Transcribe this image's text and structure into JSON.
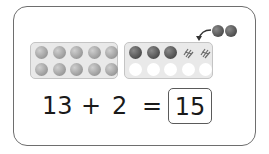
{
  "illustration": {
    "left_tray": {
      "filled": 10,
      "color": "grey"
    },
    "right_tray": {
      "top_row": [
        "dark",
        "dark",
        "dark",
        "scribble",
        "scribble"
      ],
      "bottom_row": [
        "empty",
        "empty",
        "empty",
        "empty",
        "empty"
      ]
    },
    "incoming_counters": 2,
    "colors": {
      "grey_counter": "#a8a8a8",
      "dark_counter": "#5e5e5e",
      "tray": "#e9e9e9",
      "frame": "#6e6e6e"
    }
  },
  "equation": {
    "addend1": "13",
    "plus": "+",
    "addend2": "2",
    "equals": "=",
    "answer": "15"
  }
}
